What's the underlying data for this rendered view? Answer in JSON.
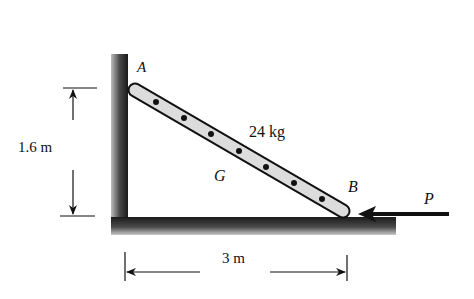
{
  "diagram": {
    "labels": {
      "point_a": "A",
      "point_b": "B",
      "center_g": "G",
      "mass": "24 kg",
      "force_p": "P",
      "height_dim": "1.6 m",
      "width_dim": "3 m"
    },
    "ladder": {
      "top": [
        135,
        90
      ],
      "bottom": [
        343,
        211
      ],
      "dot_count": 7
    },
    "colors": {
      "ink": "#111111",
      "ladder_fill": "#d9d9d9",
      "ground_shade": "#3a3a3a"
    }
  }
}
